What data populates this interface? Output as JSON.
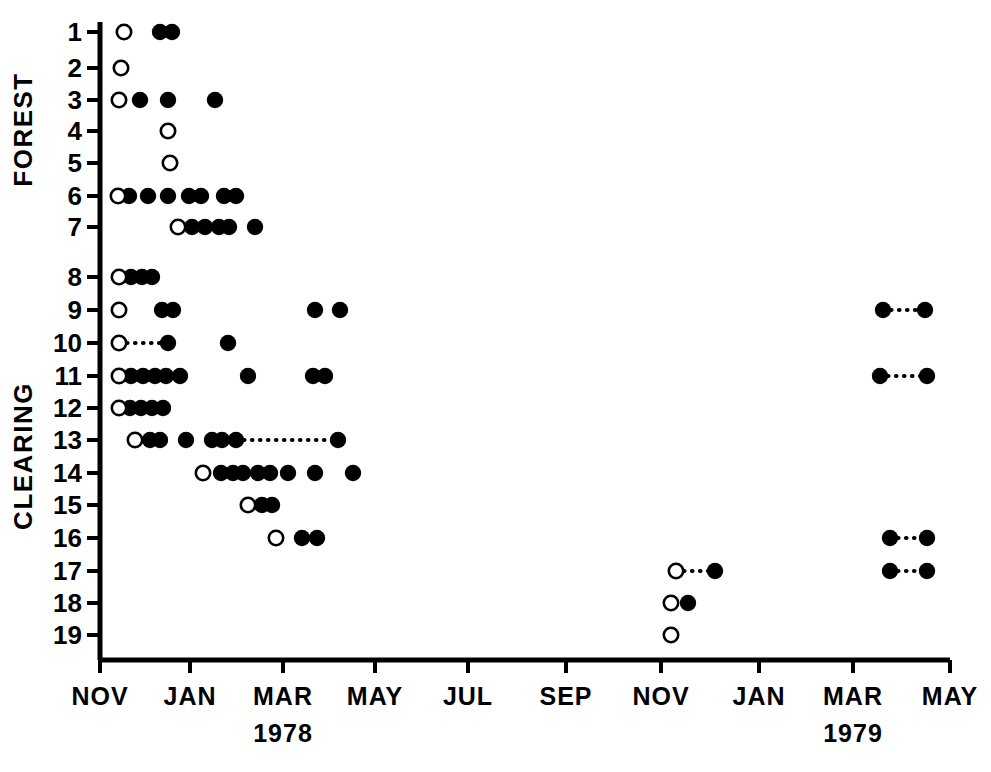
{
  "chart_data": {
    "type": "scatter",
    "title": "",
    "xlabel": "",
    "ylabel": "",
    "grid": false,
    "legend": "none",
    "x_axis": {
      "tick_labels": [
        "NOV",
        "JAN",
        "MAR",
        "MAY",
        "JUL",
        "SEP",
        "NOV",
        "JAN",
        "MAR",
        "MAY"
      ],
      "tick_px": [
        100,
        190,
        283,
        375,
        468,
        566,
        661,
        759,
        853,
        950
      ],
      "year_annotations": [
        {
          "label": "1978",
          "tick_index": 2
        },
        {
          "label": "1979",
          "tick_index": 8
        }
      ],
      "range_months": [
        "1977-11",
        "1979-05"
      ]
    },
    "y_axis": {
      "tick_labels": [
        "1",
        "2",
        "3",
        "4",
        "5",
        "6",
        "7",
        "8",
        "9",
        "10",
        "11",
        "12",
        "13",
        "14",
        "15",
        "16",
        "17",
        "18",
        "19"
      ],
      "tick_px": [
        32,
        68,
        100,
        131,
        163,
        196,
        227,
        277,
        310,
        343,
        376,
        408,
        440,
        473,
        505,
        538,
        571,
        603,
        635
      ],
      "group_labels": [
        {
          "label": "FOREST",
          "rows": [
            "1",
            "7"
          ]
        },
        {
          "label": "CLEARING",
          "rows": [
            "8",
            "19"
          ]
        }
      ]
    },
    "marker_legend": {
      "open": "open-circle",
      "filled": "filled-circle",
      "connector": "dotted-line"
    },
    "rows": [
      {
        "row": "1",
        "open": [
          124
        ],
        "filled": [
          160,
          172
        ],
        "links": []
      },
      {
        "row": "2",
        "open": [
          121
        ],
        "filled": [],
        "links": []
      },
      {
        "row": "3",
        "open": [
          119
        ],
        "filled": [
          140,
          168,
          215
        ],
        "links": []
      },
      {
        "row": "4",
        "open": [
          168
        ],
        "filled": [],
        "links": []
      },
      {
        "row": "5",
        "open": [
          170
        ],
        "filled": [],
        "links": []
      },
      {
        "row": "6",
        "open": [
          118
        ],
        "filled": [
          129,
          148,
          168,
          189,
          201,
          224,
          236
        ],
        "links": []
      },
      {
        "row": "7",
        "open": [
          178
        ],
        "filled": [
          192,
          205,
          219,
          229,
          255
        ],
        "links": []
      },
      {
        "row": "8",
        "open": [
          119
        ],
        "filled": [
          131,
          142,
          152
        ],
        "links": []
      },
      {
        "row": "9",
        "open": [
          119
        ],
        "filled": [
          162,
          173,
          315,
          340
        ],
        "links": []
      },
      {
        "row": "10",
        "open": [
          119
        ],
        "filled": [
          168,
          228
        ],
        "links": [
          [
            119,
            168
          ]
        ]
      },
      {
        "row": "11",
        "open": [
          119
        ],
        "filled": [
          131,
          143,
          155,
          166,
          180,
          248,
          313,
          325
        ],
        "links": []
      },
      {
        "row": "12",
        "open": [
          119
        ],
        "filled": [
          130,
          141,
          152,
          163
        ],
        "links": []
      },
      {
        "row": "13",
        "open": [
          135
        ],
        "filled": [
          150,
          160,
          186,
          212,
          222,
          236,
          338
        ],
        "links": [
          [
            236,
            338
          ]
        ]
      },
      {
        "row": "14",
        "open": [
          203
        ],
        "filled": [
          221,
          233,
          243,
          258,
          270,
          288,
          315,
          353
        ],
        "links": []
      },
      {
        "row": "15",
        "open": [
          248
        ],
        "filled": [
          262,
          272
        ],
        "links": []
      },
      {
        "row": "16",
        "open": [
          276
        ],
        "filled": [
          302,
          317
        ],
        "links": []
      },
      {
        "row": "17",
        "open": [
          676
        ],
        "filled": [
          715
        ],
        "links": [
          [
            676,
            715
          ]
        ]
      },
      {
        "row": "18",
        "open": [
          671
        ],
        "filled": [
          688
        ],
        "links": []
      },
      {
        "row": "19",
        "open": [
          671
        ],
        "filled": [],
        "links": []
      }
    ],
    "rows_1979": [
      {
        "row": "9",
        "open": [],
        "filled": [
          883,
          925
        ],
        "links": [
          [
            883,
            925
          ]
        ]
      },
      {
        "row": "11",
        "open": [],
        "filled": [
          880,
          927
        ],
        "links": [
          [
            880,
            927
          ]
        ]
      },
      {
        "row": "16",
        "open": [],
        "filled": [
          890,
          927
        ],
        "links": [
          [
            890,
            927
          ]
        ]
      },
      {
        "row": "17",
        "open": [],
        "filled": [
          890,
          927
        ],
        "links": [
          [
            890,
            927
          ]
        ]
      }
    ]
  }
}
